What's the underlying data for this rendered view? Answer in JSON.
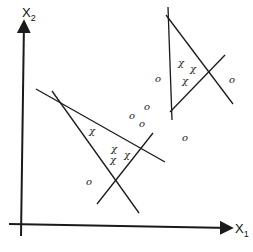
{
  "diagram": {
    "title": "",
    "colors": {
      "ink": "#1a1a1a",
      "background": "#ffffff"
    },
    "axes": {
      "x": {
        "label": "X",
        "subscript": "1",
        "from": [
          9,
          224
        ],
        "to": [
          231,
          228
        ]
      },
      "y": {
        "label": "X",
        "subscript": "2",
        "from": [
          21,
          236
        ],
        "to": [
          24,
          22
        ]
      }
    },
    "regions": [
      {
        "name": "lower-left-triangle",
        "lines": [
          {
            "from": [
              36,
              89
            ],
            "to": [
              165,
              162
            ]
          },
          {
            "from": [
              52,
              91
            ],
            "to": [
              139,
              213
            ]
          },
          {
            "from": [
              97,
              204
            ],
            "to": [
              153,
              133
            ]
          }
        ]
      },
      {
        "name": "upper-right-triangle",
        "lines": [
          {
            "from": [
              168,
              7
            ],
            "to": [
              172,
              120
            ]
          },
          {
            "from": [
              166,
              15
            ],
            "to": [
              233,
              104
            ]
          },
          {
            "from": [
              170,
              112
            ],
            "to": [
              225,
              55
            ]
          }
        ]
      }
    ],
    "points": {
      "x_class": {
        "symbol": "χ",
        "positions": [
          [
            92,
            131
          ],
          [
            114,
            149
          ],
          [
            127,
            155
          ],
          [
            113,
            160
          ],
          [
            181,
            63
          ],
          [
            193,
            69
          ],
          [
            185,
            81
          ]
        ]
      },
      "o_class": {
        "symbol": "o",
        "positions": [
          [
            89,
            182
          ],
          [
            147,
            107
          ],
          [
            132,
            116
          ],
          [
            142,
            124
          ],
          [
            185,
            138
          ],
          [
            158,
            79
          ],
          [
            232,
            80
          ]
        ]
      }
    }
  }
}
